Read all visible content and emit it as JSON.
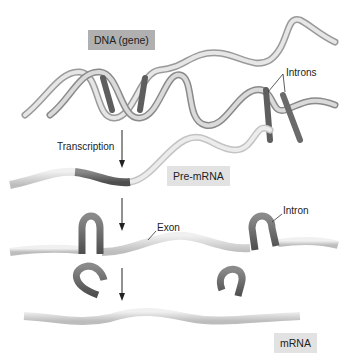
{
  "diagram": {
    "type": "process-flow",
    "labels": {
      "dna": "DNA (gene)",
      "introns": "Introns",
      "transcription": "Transcription",
      "pre_mrna": "Pre-mRNA",
      "exon": "Exon",
      "intron": "Intron",
      "mrna": "mRNA"
    },
    "stages": [
      {
        "id": "dna",
        "label": "DNA (gene)"
      },
      {
        "id": "pre-mrna",
        "label": "Pre-mRNA"
      },
      {
        "id": "spliced",
        "label": "Exon / Intron"
      },
      {
        "id": "mrna",
        "label": "mRNA"
      }
    ],
    "edges": [
      {
        "from": "dna",
        "to": "pre-mrna",
        "label": "Transcription"
      },
      {
        "from": "pre-mrna",
        "to": "spliced",
        "label": ""
      },
      {
        "from": "spliced",
        "to": "mrna",
        "label": ""
      }
    ],
    "colors": {
      "dna_box": "#b0b0b0",
      "pre_mrna_box": "#e2e2e2",
      "mrna_box": "#e2e2e2",
      "ribbon_light": "#d8d8d8",
      "ribbon_dark": "#6a6a6a",
      "text": "#222222"
    }
  }
}
